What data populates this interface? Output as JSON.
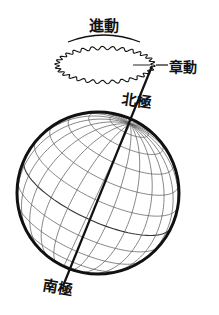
{
  "diagram": {
    "title": "",
    "labels": {
      "precession": "進動",
      "nutation": "章動",
      "nutation_dash": "—",
      "north_pole": "北極",
      "south_pole": "南極"
    },
    "colors": {
      "background": "#ffffff",
      "ink": "#111111",
      "grid": "#555555"
    },
    "globe": {
      "cx": 98,
      "cy": 193,
      "r": 81,
      "axis_tilt_deg": 25,
      "view_tilt_deg": 20,
      "parallels_deg": [
        -75,
        -60,
        -45,
        -30,
        -15,
        0,
        15,
        30,
        45,
        60,
        75
      ],
      "meridian_step_deg": 15
    },
    "axis": {
      "x1": 152,
      "y1": 66,
      "x2": 63,
      "y2": 286
    },
    "precession_path": {
      "cx": 105,
      "cy": 65,
      "rx": 48,
      "ry": 17,
      "wiggles": 30,
      "amplitude": 2.2
    },
    "precession_arc": {
      "x1": 68,
      "y1": 42,
      "x2": 140,
      "y2": 42,
      "bulge": 7
    },
    "nutation_marker": {
      "x1": 133,
      "y1": 65,
      "x2": 150,
      "y2": 65
    }
  }
}
